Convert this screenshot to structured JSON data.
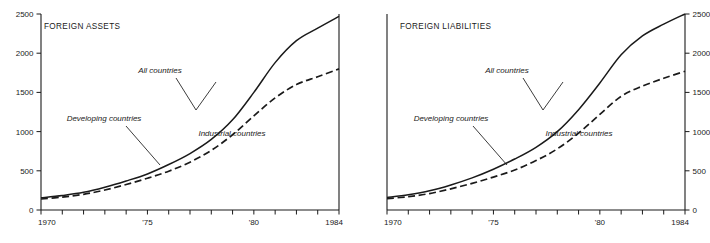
{
  "figure": {
    "background": "#ffffff",
    "ink": "#1a1a1a"
  },
  "panels": [
    {
      "id": "foreign-assets",
      "title": "FOREIGN ASSETS",
      "y_axis_side": "left",
      "annotations": {
        "all_countries": "All countries",
        "developing_countries": "Developing countries",
        "industrial_countries": "Industrial countries"
      }
    },
    {
      "id": "foreign-liabilities",
      "title": "FOREIGN LIABILITIES",
      "y_axis_side": "right",
      "annotations": {
        "all_countries": "All countries",
        "developing_countries": "Developing countries",
        "industrial_countries": "Industrial countries"
      }
    }
  ],
  "chart_data": [
    {
      "type": "line",
      "title": "FOREIGN ASSETS",
      "xlabel": "",
      "ylabel": "",
      "xlim": [
        1970,
        1984
      ],
      "ylim": [
        0,
        2500
      ],
      "yticks": [
        0,
        500,
        1000,
        1500,
        2000,
        2500
      ],
      "ytick_labels": [
        "0",
        "500",
        "1000",
        "1500",
        "2000",
        "2500"
      ],
      "y_axis_side": "left",
      "xticks": [
        1970,
        1971,
        1972,
        1973,
        1974,
        1975,
        1976,
        1977,
        1978,
        1979,
        1980,
        1981,
        1982,
        1983,
        1984
      ],
      "xtick_labels": [
        "1970",
        "",
        "",
        "",
        "",
        "'75",
        "",
        "",
        "",
        "",
        "'80",
        "",
        "",
        "",
        "1984"
      ],
      "grid": false,
      "legend_position": "inline-annotations",
      "x": [
        1970,
        1971,
        1972,
        1973,
        1974,
        1975,
        1976,
        1977,
        1978,
        1979,
        1980,
        1981,
        1982,
        1983,
        1984
      ],
      "series": [
        {
          "name": "All countries",
          "style": "solid",
          "values": [
            155,
            185,
            225,
            290,
            370,
            460,
            580,
            720,
            900,
            1150,
            1500,
            1880,
            2160,
            2320,
            2470
          ]
        },
        {
          "name": "Developing countries",
          "style": "dashed",
          "values": [
            140,
            165,
            200,
            255,
            325,
            405,
            495,
            610,
            760,
            960,
            1200,
            1430,
            1600,
            1700,
            1800
          ]
        }
      ],
      "annotations": [
        {
          "text": "All countries",
          "x": 1976.6,
          "y": 1880
        },
        {
          "text": "Developing countries",
          "x": 1973.4,
          "y": 1300
        },
        {
          "text": "Industrial countries",
          "x": 1978.7,
          "y": 690
        }
      ]
    },
    {
      "type": "line",
      "title": "FOREIGN LIABILITIES",
      "xlabel": "",
      "ylabel": "",
      "xlim": [
        1970,
        1984
      ],
      "ylim": [
        0,
        2500
      ],
      "yticks": [
        0,
        500,
        1000,
        1500,
        2000,
        2500
      ],
      "ytick_labels": [
        "0",
        "500",
        "1000",
        "1500",
        "2000",
        "2500"
      ],
      "y_axis_side": "right",
      "xticks": [
        1970,
        1971,
        1972,
        1973,
        1974,
        1975,
        1976,
        1977,
        1978,
        1979,
        1980,
        1981,
        1982,
        1983,
        1984
      ],
      "xtick_labels": [
        "1970",
        "",
        "",
        "",
        "",
        "'75",
        "",
        "",
        "",
        "",
        "'80",
        "",
        "",
        "",
        "1984"
      ],
      "grid": false,
      "legend_position": "inline-annotations",
      "x": [
        1970,
        1971,
        1972,
        1973,
        1974,
        1975,
        1976,
        1977,
        1978,
        1979,
        1980,
        1981,
        1982,
        1983,
        1984
      ],
      "series": [
        {
          "name": "All countries",
          "style": "solid",
          "values": [
            160,
            195,
            245,
            320,
            410,
            520,
            650,
            800,
            1000,
            1280,
            1620,
            1980,
            2220,
            2370,
            2500
          ]
        },
        {
          "name": "Developing countries",
          "style": "dashed",
          "values": [
            145,
            170,
            210,
            270,
            340,
            420,
            510,
            630,
            780,
            980,
            1220,
            1450,
            1580,
            1680,
            1770
          ]
        }
      ],
      "annotations": [
        {
          "text": "All countries",
          "x": 1976.4,
          "y": 1860
        },
        {
          "text": "Developing countries",
          "x": 1973.2,
          "y": 1270
        },
        {
          "text": "Industrial countries",
          "x": 1978.6,
          "y": 690
        }
      ]
    }
  ]
}
